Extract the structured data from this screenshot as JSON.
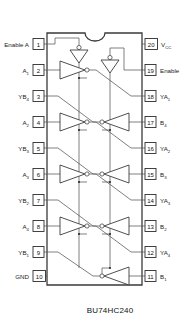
{
  "diagram": {
    "title": "BU74HC240",
    "device_type": "20-pin DIP logic symbol diagram",
    "notch": "top-center-notch",
    "pins_left": [
      {
        "num": "1",
        "label": "Enable",
        "sub": "",
        "suffix": " A"
      },
      {
        "num": "2",
        "label": "A",
        "sub": "1",
        "suffix": ""
      },
      {
        "num": "3",
        "label": "YB",
        "sub": "4",
        "suffix": ""
      },
      {
        "num": "4",
        "label": "A",
        "sub": "2",
        "suffix": ""
      },
      {
        "num": "5",
        "label": "YB",
        "sub": "3",
        "suffix": ""
      },
      {
        "num": "6",
        "label": "A",
        "sub": "3",
        "suffix": ""
      },
      {
        "num": "7",
        "label": "YB",
        "sub": "2",
        "suffix": ""
      },
      {
        "num": "8",
        "label": "A",
        "sub": "4",
        "suffix": ""
      },
      {
        "num": "9",
        "label": "YB",
        "sub": "1",
        "suffix": ""
      },
      {
        "num": "10",
        "label": "GND",
        "sub": "",
        "suffix": ""
      }
    ],
    "pins_right": [
      {
        "num": "20",
        "label": "V",
        "sub": "CC",
        "suffix": ""
      },
      {
        "num": "19",
        "label": "Enable",
        "sub": "",
        "suffix": ""
      },
      {
        "num": "18",
        "label": "YA",
        "sub": "1",
        "suffix": ""
      },
      {
        "num": "17",
        "label": "B",
        "sub": "4",
        "suffix": ""
      },
      {
        "num": "16",
        "label": "YA",
        "sub": "2",
        "suffix": ""
      },
      {
        "num": "15",
        "label": "B",
        "sub": "3",
        "suffix": ""
      },
      {
        "num": "14",
        "label": "YA",
        "sub": "3",
        "suffix": ""
      },
      {
        "num": "13",
        "label": "B",
        "sub": "2",
        "suffix": ""
      },
      {
        "num": "12",
        "label": "YA",
        "sub": "4",
        "suffix": ""
      },
      {
        "num": "11",
        "label": "B",
        "sub": "1",
        "suffix": ""
      }
    ],
    "gates": {
      "enable_inverters": 2,
      "left_buffers": 4,
      "right_buffers": 4,
      "symbol": "inverting-tri-state-buffer"
    },
    "colors": {
      "background": "#ffffff",
      "outline": "#3a3a3a",
      "wire": "#55555a",
      "text": "#1a1a1a"
    }
  }
}
